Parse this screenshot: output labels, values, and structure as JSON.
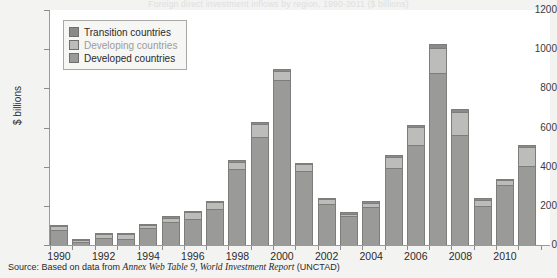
{
  "figure": {
    "title_cutoff": "Foreign direct investment inflows by region, 1990-2011 ($ billions)",
    "ylabel": "$ billions",
    "source_prefix": "Source: Based on data from ",
    "source_italic": "Annex Web Table 9, World Investment Report",
    "source_suffix": " (UNCTAD)"
  },
  "legend": {
    "position": "top-left-inside",
    "items": [
      {
        "label": "Transition countries",
        "color": "#8a8a88",
        "key": "transition"
      },
      {
        "label": "Developing countries",
        "color": "#bcbcba",
        "key": "developing"
      },
      {
        "label": "Developed countries",
        "color": "#9a9a98",
        "key": "developed"
      }
    ]
  },
  "chart_data": {
    "type": "bar",
    "stacked": true,
    "title": "Foreign direct investment inflows by region, 1990-2011 ($ billions)",
    "xlabel": "",
    "ylabel": "$ billions",
    "ylim": [
      0,
      1200
    ],
    "yticks": [
      0,
      200,
      400,
      600,
      800,
      1000,
      1200
    ],
    "grid": false,
    "categories": [
      "1990",
      "1991",
      "1992",
      "1993",
      "1994",
      "1995",
      "1996",
      "1997",
      "1998",
      "1999",
      "2000",
      "2001",
      "2002",
      "2003",
      "2004",
      "2005",
      "2006",
      "2007",
      "2008",
      "2009",
      "2010",
      "2011"
    ],
    "xtick_labels": [
      "1990",
      "1992",
      "1994",
      "1996",
      "1998",
      "2000",
      "2002",
      "2004",
      "2006",
      "2008",
      "2010"
    ],
    "series": [
      {
        "name": "Developed countries",
        "color": "#9a9a98",
        "values": [
          78,
          15,
          35,
          30,
          85,
          115,
          135,
          185,
          390,
          550,
          845,
          380,
          210,
          150,
          195,
          395,
          510,
          880,
          560,
          200,
          305,
          405
        ]
      },
      {
        "name": "Developing countries",
        "color": "#bcbcba",
        "values": [
          20,
          10,
          20,
          25,
          18,
          25,
          35,
          35,
          35,
          70,
          45,
          35,
          25,
          10,
          20,
          55,
          95,
          125,
          120,
          30,
          25,
          95
        ]
      },
      {
        "name": "Transition countries",
        "color": "#8a8a88",
        "values": [
          2,
          2,
          2,
          2,
          2,
          3,
          3,
          5,
          8,
          5,
          8,
          5,
          5,
          8,
          8,
          10,
          10,
          20,
          15,
          10,
          8,
          10
        ]
      }
    ],
    "totals": [
      100,
      27,
      57,
      57,
      103,
      143,
      173,
      225,
      433,
      625,
      898,
      420,
      240,
      168,
      223,
      460,
      615,
      1025,
      695,
      240,
      338,
      510
    ]
  }
}
